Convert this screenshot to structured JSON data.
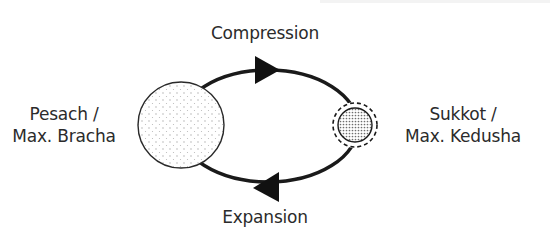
{
  "diagram": {
    "labels": {
      "top": "Compression",
      "bottom": "Expansion",
      "left_line1": "Pesach /",
      "left_line2": "Max. Bracha",
      "right_line1": "Sukkot /",
      "right_line2": "Max. Kedusha"
    },
    "nodes": [
      {
        "id": "pesach",
        "label": "Pesach / Max. Bracha",
        "shape": "large-dotted-circle"
      },
      {
        "id": "sukkot",
        "label": "Sukkot / Max. Kedusha",
        "shape": "small-dense-dotted-circle-with-dashed-ring"
      }
    ],
    "edges": [
      {
        "from": "pesach",
        "to": "sukkot",
        "label": "Compression",
        "direction": "clockwise-top"
      },
      {
        "from": "sukkot",
        "to": "pesach",
        "label": "Expansion",
        "direction": "clockwise-bottom"
      }
    ],
    "colors": {
      "stroke": "#1a1a1a",
      "text": "#2b2b2b",
      "circle_fill": "#ffffff",
      "dot": "#9a9a9a",
      "dense_dot": "#707070"
    }
  }
}
